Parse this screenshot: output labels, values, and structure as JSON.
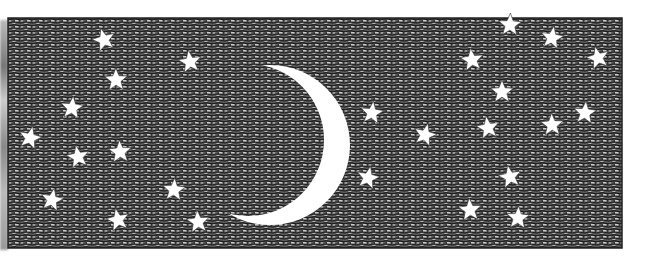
{
  "illustration": {
    "subject": "crescent moon and stars in a night sky",
    "style": "black and white pen-and-ink crosshatch",
    "colors": {
      "ink": "#1a1a1a",
      "paper": "#ffffff",
      "mid": "#4a4a4a"
    },
    "frame": {
      "x": 8,
      "y": 18,
      "width": 614,
      "height": 230
    },
    "moon": {
      "phase": "crescent",
      "outer": {
        "cx": 270,
        "cy": 145,
        "r": 80
      },
      "inner": {
        "cx": 248,
        "cy": 140,
        "r": 76
      }
    },
    "stars": [
      [
        104,
        40
      ],
      [
        190,
        62
      ],
      [
        116,
        80
      ],
      [
        72,
        108
      ],
      [
        30,
        138
      ],
      [
        78,
        157
      ],
      [
        120,
        152
      ],
      [
        174,
        190
      ],
      [
        52,
        200
      ],
      [
        118,
        220
      ],
      [
        198,
        222
      ],
      [
        510,
        25
      ],
      [
        552,
        38
      ],
      [
        598,
        58
      ],
      [
        472,
        60
      ],
      [
        502,
        92
      ],
      [
        372,
        113
      ],
      [
        425,
        135
      ],
      [
        488,
        128
      ],
      [
        552,
        125
      ],
      [
        585,
        113
      ],
      [
        368,
        178
      ],
      [
        510,
        177
      ],
      [
        470,
        210
      ],
      [
        518,
        218
      ]
    ]
  }
}
